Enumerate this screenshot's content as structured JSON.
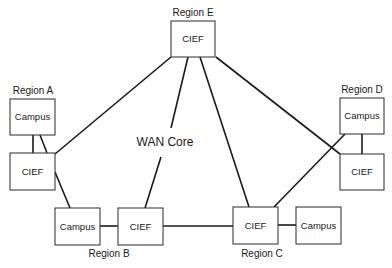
{
  "diagram": {
    "core_label": "WAN Core",
    "regions": [
      {
        "id": "A",
        "label": "Region A"
      },
      {
        "id": "B",
        "label": "Region B"
      },
      {
        "id": "C",
        "label": "Region C"
      },
      {
        "id": "D",
        "label": "Region D"
      },
      {
        "id": "E",
        "label": "Region E"
      }
    ],
    "nodes": [
      {
        "id": "E_cief",
        "region": "E",
        "label": "CIEF"
      },
      {
        "id": "A_campus",
        "region": "A",
        "label": "Campus"
      },
      {
        "id": "A_cief",
        "region": "A",
        "label": "CIEF"
      },
      {
        "id": "B_campus",
        "region": "B",
        "label": "Campus"
      },
      {
        "id": "B_cief",
        "region": "B",
        "label": "CIEF"
      },
      {
        "id": "C_cief",
        "region": "C",
        "label": "CIEF"
      },
      {
        "id": "C_campus",
        "region": "C",
        "label": "Campus"
      },
      {
        "id": "D_campus",
        "region": "D",
        "label": "Campus"
      },
      {
        "id": "D_cief",
        "region": "D",
        "label": "CIEF"
      }
    ],
    "links": [
      {
        "from": "E_cief",
        "to": "A_cief"
      },
      {
        "from": "E_cief",
        "to": "B_cief"
      },
      {
        "from": "E_cief",
        "to": "C_cief"
      },
      {
        "from": "E_cief",
        "to": "D_cief"
      },
      {
        "from": "A_campus",
        "to": "A_cief"
      },
      {
        "from": "A_campus",
        "to": "A_cief"
      },
      {
        "from": "A_cief",
        "to": "B_campus"
      },
      {
        "from": "B_campus",
        "to": "B_cief"
      },
      {
        "from": "B_cief",
        "to": "C_cief"
      },
      {
        "from": "C_cief",
        "to": "C_campus"
      },
      {
        "from": "C_cief",
        "to": "D_campus"
      },
      {
        "from": "D_campus",
        "to": "D_cief"
      }
    ]
  }
}
